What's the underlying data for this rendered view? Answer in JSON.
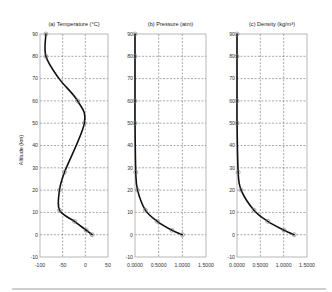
{
  "chart_data": [
    {
      "type": "line",
      "title": "(a) Temperature (°C)",
      "xlabel": "",
      "ylabel": "Altitude (km)",
      "xlim": [
        -100,
        50
      ],
      "ylim": [
        -10,
        90
      ],
      "xticks": [
        -100,
        -50,
        0,
        50
      ],
      "xtick_labels": [
        "-100",
        "-50",
        "0",
        "50"
      ],
      "yticks": [
        -10,
        0,
        10,
        20,
        30,
        40,
        50,
        60,
        70,
        80,
        90
      ],
      "grid": true,
      "series": [
        {
          "name": "Temperature",
          "x": [
            15,
            2,
            -24,
            -57,
            -57,
            -46,
            -2,
            -17,
            -58,
            -87,
            -87
          ],
          "y": [
            0,
            2,
            6,
            11,
            20,
            28,
            50,
            60,
            70,
            80,
            90
          ]
        }
      ],
      "markers": {
        "x": [
          15,
          2,
          -24,
          -57,
          -57,
          -46,
          -2,
          -17,
          -87,
          -87
        ],
        "y": [
          0,
          2,
          6,
          11,
          20,
          28,
          50,
          60,
          80,
          90
        ]
      }
    },
    {
      "type": "line",
      "title": "(b) Pressure (atm)",
      "xlabel": "",
      "ylabel": "",
      "xlim": [
        0,
        1.5
      ],
      "ylim": [
        -10,
        90
      ],
      "xticks": [
        0,
        0.5,
        1.0,
        1.5
      ],
      "xtick_labels": [
        "0.0000",
        "0.5000",
        "1.0000",
        "1.5000"
      ],
      "yticks": [
        -10,
        0,
        10,
        20,
        30,
        40,
        50,
        60,
        70,
        80,
        90
      ],
      "grid": true,
      "series": [
        {
          "name": "Pressure",
          "x": [
            1.0,
            0.78,
            0.47,
            0.22,
            0.054,
            0.016,
            0.0008,
            0.0002,
            5e-05,
            1e-05,
            2e-06
          ],
          "y": [
            0,
            2,
            6,
            11,
            20,
            28,
            50,
            60,
            70,
            80,
            90
          ]
        }
      ],
      "markers": {
        "x": [
          1.0,
          0.78,
          0.47,
          0.22,
          0.054,
          0.016,
          0.0008,
          0.0002,
          1e-05,
          2e-06
        ],
        "y": [
          0,
          2,
          6,
          11,
          20,
          28,
          50,
          60,
          80,
          90
        ]
      }
    },
    {
      "type": "line",
      "title": "(c) Density (kg/m³)",
      "xlabel": "",
      "ylabel": "",
      "xlim": [
        0,
        1.5
      ],
      "ylim": [
        -10,
        90
      ],
      "xticks": [
        0,
        0.5,
        1.0,
        1.5
      ],
      "xtick_labels": [
        "0.0000",
        "0.5000",
        "1.0000",
        "1.5000"
      ],
      "yticks": [
        -10,
        0,
        10,
        20,
        30,
        40,
        50,
        60,
        70,
        80,
        90
      ],
      "grid": true,
      "series": [
        {
          "name": "Density",
          "x": [
            1.225,
            1.007,
            0.66,
            0.364,
            0.089,
            0.025,
            0.001,
            0.0003,
            8e-05,
            2e-05,
            3e-06
          ],
          "y": [
            0,
            2,
            6,
            11,
            20,
            28,
            50,
            60,
            70,
            80,
            90
          ]
        }
      ],
      "markers": {
        "x": [
          1.225,
          1.007,
          0.66,
          0.364,
          0.089,
          0.025,
          0.001,
          0.0003,
          2e-05,
          3e-06
        ],
        "y": [
          0,
          2,
          6,
          11,
          20,
          28,
          50,
          60,
          80,
          90
        ]
      }
    }
  ],
  "figure": {
    "ylabel": "Altitude (km)",
    "colors": {
      "curve": "#111111",
      "grid": "#555555",
      "frame": "#999999",
      "marker": "#777777"
    }
  }
}
